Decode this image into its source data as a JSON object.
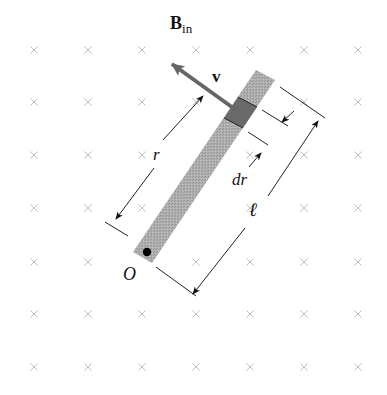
{
  "figure": {
    "field_label": "B",
    "field_subscript": "in",
    "velocity_label": "v",
    "radius_label": "r",
    "element_label": "dr",
    "length_label": "ℓ",
    "pivot_label": "O"
  },
  "field_grid": {
    "symbol": "×",
    "icon": "into-page-x-icon",
    "columns_x": [
      34,
      88,
      142,
      196,
      250,
      304,
      358
    ],
    "rows_y": [
      50,
      102,
      155,
      208,
      262,
      314,
      367
    ],
    "color": "#b8b8b8"
  },
  "colors": {
    "rod_fill": "#a9a9a9",
    "element_fill": "#6a6a6a",
    "velocity_arrow": "#666666",
    "lines": "#222222"
  }
}
